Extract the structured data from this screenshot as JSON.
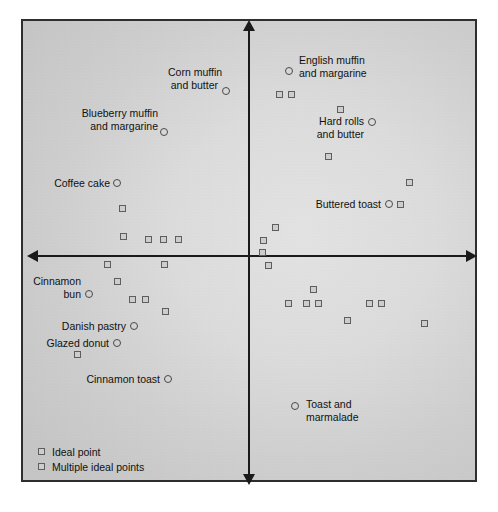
{
  "chart_data": {
    "type": "scatter",
    "title": "",
    "xlabel": "",
    "ylabel": "",
    "xlim": [
      -1,
      1
    ],
    "ylim": [
      -1,
      1
    ],
    "grid": false,
    "axes": {
      "style": "double-headed-arrows-through-origin",
      "origin_px": [
        249,
        256
      ],
      "x_axis_from_px": 27,
      "x_axis_to_px": 475,
      "y_axis_from_px": 20,
      "y_axis_to_px": 480
    },
    "legend": {
      "position": "bottom-left-inside",
      "entries": [
        {
          "key": "ideal-point",
          "marker": "square",
          "label": "Ideal point"
        },
        {
          "key": "multiple-ideal-points",
          "marker": "square",
          "label": "Multiple ideal points"
        }
      ]
    },
    "products": [
      {
        "label": "Corn muffin\nand butter",
        "align": "right",
        "marker": "circle",
        "x_px": 226,
        "y_px": 91,
        "label_x_px": 168,
        "label_y_px": 66,
        "label_w_px": 50
      },
      {
        "label": "English muffin\nand margarine",
        "align": "left",
        "marker": "circle",
        "x_px": 289,
        "y_px": 71,
        "label_x_px": 299,
        "label_y_px": 54,
        "label_w_px": 95
      },
      {
        "label": "Blueberry muffin\nand margarine",
        "align": "right",
        "marker": "circle",
        "x_px": 164,
        "y_px": 132,
        "label_x_px": 72,
        "label_y_px": 107,
        "label_w_px": 86
      },
      {
        "label": "Hard rolls\nand butter",
        "align": "right",
        "marker": "circle",
        "x_px": 372,
        "y_px": 122,
        "label_x_px": 304,
        "label_y_px": 115,
        "label_w_px": 60
      },
      {
        "label": "Coffee cake",
        "align": "right",
        "marker": "circle",
        "x_px": 117,
        "y_px": 183,
        "label_x_px": 42,
        "label_y_px": 177,
        "label_w_px": 68
      },
      {
        "label": "Buttered toast",
        "align": "right",
        "marker": "circle",
        "x_px": 389,
        "y_px": 204,
        "label_x_px": 305,
        "label_y_px": 198,
        "label_w_px": 76
      },
      {
        "label": "Cinnamon\nbun",
        "align": "right",
        "marker": "circle",
        "x_px": 89,
        "y_px": 294,
        "label_x_px": 19,
        "label_y_px": 275,
        "label_w_px": 62
      },
      {
        "label": "Danish pastry",
        "align": "right",
        "marker": "circle",
        "x_px": 134,
        "y_px": 326,
        "label_x_px": 50,
        "label_y_px": 320,
        "label_w_px": 76
      },
      {
        "label": "Glazed donut",
        "align": "right",
        "marker": "circle",
        "x_px": 117,
        "y_px": 343,
        "label_x_px": 33,
        "label_y_px": 337,
        "label_w_px": 76
      },
      {
        "label": "Cinnamon toast",
        "align": "right",
        "marker": "circle",
        "x_px": 168,
        "y_px": 379,
        "label_x_px": 76,
        "label_y_px": 373,
        "label_w_px": 84
      },
      {
        "label": "Toast and\nmarmalade",
        "align": "left",
        "marker": "circle",
        "x_px": 295,
        "y_px": 406,
        "label_x_px": 306,
        "label_y_px": 398,
        "label_w_px": 72
      }
    ],
    "ideal_points_px": [
      [
        122,
        208
      ],
      [
        123,
        236
      ],
      [
        148,
        239
      ],
      [
        163,
        239
      ],
      [
        178,
        239
      ],
      [
        275,
        227
      ],
      [
        263,
        240
      ],
      [
        262,
        252
      ],
      [
        268,
        265
      ],
      [
        279,
        94
      ],
      [
        291,
        94
      ],
      [
        340,
        109
      ],
      [
        328,
        156
      ],
      [
        409,
        182
      ],
      [
        400,
        204
      ],
      [
        107,
        264
      ],
      [
        164,
        264
      ],
      [
        117,
        281
      ],
      [
        132,
        299
      ],
      [
        145,
        299
      ],
      [
        165,
        311
      ],
      [
        77,
        354
      ],
      [
        313,
        289
      ],
      [
        288,
        303
      ],
      [
        306,
        303
      ],
      [
        318,
        303
      ],
      [
        369,
        303
      ],
      [
        381,
        303
      ],
      [
        347,
        320
      ],
      [
        424,
        323
      ]
    ]
  }
}
